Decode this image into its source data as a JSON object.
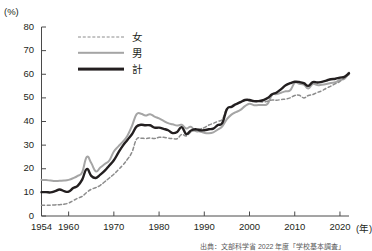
{
  "chart_data": {
    "type": "line",
    "title": "",
    "xlabel": "(年)",
    "ylabel": "(%)",
    "xlim": [
      1954,
      2022
    ],
    "ylim": [
      0,
      80
    ],
    "ytick_step": 10,
    "grid": false,
    "legend_position": "top-center",
    "yticks": [
      "80",
      "70",
      "60",
      "50",
      "40",
      "30",
      "20",
      "10",
      "0"
    ],
    "xticks": [
      "1954",
      "1960",
      "1970",
      "1980",
      "1990",
      "2000",
      "2010",
      "2020"
    ],
    "colors": {
      "female": "#8c8c8c",
      "male": "#a5a5a5",
      "total": "#231f20"
    },
    "x": [
      1954,
      1955,
      1956,
      1957,
      1958,
      1959,
      1960,
      1961,
      1962,
      1963,
      1964,
      1965,
      1966,
      1967,
      1968,
      1969,
      1970,
      1971,
      1972,
      1973,
      1974,
      1975,
      1976,
      1977,
      1978,
      1979,
      1980,
      1981,
      1982,
      1983,
      1984,
      1985,
      1986,
      1987,
      1988,
      1989,
      1990,
      1991,
      1992,
      1993,
      1994,
      1995,
      1996,
      1997,
      1998,
      1999,
      2000,
      2001,
      2002,
      2003,
      2004,
      2005,
      2006,
      2007,
      2008,
      2009,
      2010,
      2011,
      2012,
      2013,
      2014,
      2015,
      2016,
      2017,
      2018,
      2019,
      2020,
      2021,
      2022
    ],
    "series": [
      {
        "name": "女",
        "style": "dashed",
        "values": [
          4.6,
          4.6,
          4.6,
          4.7,
          4.8,
          5.0,
          5.5,
          6.5,
          7.5,
          8.3,
          10.0,
          11.3,
          12.0,
          13.0,
          14.5,
          16.1,
          17.7,
          19.6,
          21.6,
          24.0,
          27.0,
          32.4,
          32.9,
          32.8,
          33.0,
          32.8,
          33.3,
          33.3,
          33.0,
          32.8,
          32.7,
          34.5,
          33.9,
          35.5,
          36.3,
          36.8,
          37.4,
          38.5,
          39.2,
          40.1,
          41.0,
          45.4,
          46.5,
          47.6,
          48.0,
          49.0,
          48.7,
          48.5,
          48.5,
          48.3,
          48.6,
          49.1,
          49.0,
          49.3,
          49.5,
          50.0,
          51.0,
          51.1,
          50.0,
          51.0,
          51.4,
          52.3,
          53.0,
          54.1,
          55.0,
          56.0,
          57.0,
          58.5,
          59.8
        ]
      },
      {
        "name": "男",
        "style": "solid",
        "values": [
          15.3,
          15.2,
          15.0,
          14.8,
          14.9,
          15.0,
          15.3,
          16.0,
          17.0,
          18.5,
          25.0,
          22.4,
          18.9,
          20.5,
          22.0,
          23.5,
          27.3,
          29.5,
          31.5,
          34.0,
          38.1,
          43.0,
          43.3,
          42.5,
          43.1,
          42.1,
          41.3,
          40.3,
          39.3,
          38.8,
          38.3,
          38.6,
          37.0,
          37.8,
          36.0,
          35.8,
          35.2,
          35.0,
          35.4,
          36.6,
          38.0,
          41.0,
          42.9,
          44.0,
          44.9,
          46.5,
          47.5,
          46.9,
          47.0,
          47.0,
          47.5,
          51.3,
          51.6,
          52.2,
          52.8,
          53.2,
          56.4,
          56.0,
          55.6,
          54.0,
          55.9,
          55.4,
          55.6,
          55.9,
          56.3,
          56.6,
          57.7,
          58.1,
          60.7
        ]
      },
      {
        "name": "計",
        "style": "solid-bold",
        "values": [
          10.1,
          10.1,
          10.0,
          10.5,
          11.2,
          10.5,
          10.3,
          11.8,
          12.8,
          15.4,
          19.9,
          17.0,
          16.1,
          17.5,
          19.2,
          21.4,
          23.6,
          26.8,
          29.8,
          32.2,
          34.6,
          37.8,
          38.6,
          38.4,
          38.4,
          37.4,
          37.4,
          36.9,
          36.3,
          35.1,
          35.6,
          37.6,
          34.7,
          36.1,
          36.7,
          36.3,
          36.3,
          36.7,
          37.0,
          38.5,
          39.4,
          45.2,
          46.2,
          47.3,
          48.2,
          49.1,
          49.1,
          48.6,
          48.6,
          49.0,
          49.9,
          51.5,
          52.3,
          53.7,
          55.3,
          56.2,
          56.8,
          56.7,
          56.2,
          55.1,
          56.7,
          56.5,
          56.8,
          57.3,
          57.9,
          58.1,
          58.6,
          58.9,
          60.4
        ]
      }
    ]
  },
  "axis": {
    "y_unit": "(%)",
    "x_unit": "(年)"
  },
  "legend": [
    {
      "label": "女",
      "swatch": "dashed-gray-line"
    },
    {
      "label": "男",
      "swatch": "solid-gray-line"
    },
    {
      "label": "計",
      "swatch": "solid-black-line"
    }
  ],
  "source": {
    "text": "出典：文部科学省 2022 年度「学校基本調査」"
  }
}
